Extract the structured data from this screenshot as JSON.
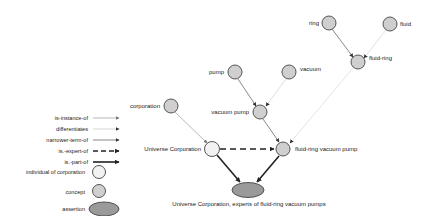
{
  "colors": {
    "concept_fill": "#cfcfcf",
    "individual_fill": "#f2f2f2",
    "assertion_fill": "#9a9a9a",
    "stroke": "#444444",
    "instance_line": "#888888",
    "differentiates_line": "#bbbbbb",
    "narrower_line": "#555555",
    "expert_line": "#222222",
    "part_line": "#222222"
  },
  "legend": {
    "edges": [
      {
        "label": "is-instance-of",
        "style": "instance"
      },
      {
        "label": "differentiates",
        "style": "differentiates"
      },
      {
        "label": "narrower-term-of",
        "style": "narrower"
      },
      {
        "label": "is.-expert-of",
        "style": "expert"
      },
      {
        "label": "is.-part-of",
        "style": "part"
      }
    ],
    "nodes": [
      {
        "label": "individual of corporation",
        "shape": "individual"
      },
      {
        "label": "concept",
        "shape": "concept"
      },
      {
        "label": "assertion",
        "shape": "assertion"
      }
    ]
  },
  "nodes": {
    "ring": {
      "label": "ring",
      "type": "concept"
    },
    "fluid": {
      "label": "fluid",
      "type": "concept"
    },
    "fluid_ring": {
      "label": "fluid-ring",
      "type": "concept"
    },
    "pump": {
      "label": "pump",
      "type": "concept"
    },
    "vacuum": {
      "label": "vacuum",
      "type": "concept"
    },
    "vacuum_pump": {
      "label": "vacuum pump",
      "type": "concept"
    },
    "corporation": {
      "label": "corporation",
      "type": "concept"
    },
    "universe_corporation": {
      "label": "Universe Corporation",
      "type": "individual"
    },
    "fluid_ring_vacuum_pump": {
      "label": "fluid-ring vacuum pump",
      "type": "concept"
    },
    "assertion": {
      "label": "Universe Corporation, experts of fluid-ring vacuum pumps",
      "type": "assertion"
    }
  },
  "edges": [
    {
      "from": "ring",
      "to": "fluid_ring",
      "relation": "narrower-term-of"
    },
    {
      "from": "fluid",
      "to": "fluid_ring",
      "relation": "differentiates"
    },
    {
      "from": "pump",
      "to": "vacuum_pump",
      "relation": "narrower-term-of"
    },
    {
      "from": "vacuum",
      "to": "vacuum_pump",
      "relation": "differentiates"
    },
    {
      "from": "vacuum_pump",
      "to": "fluid_ring_vacuum_pump",
      "relation": "narrower-term-of"
    },
    {
      "from": "fluid_ring",
      "to": "fluid_ring_vacuum_pump",
      "relation": "differentiates"
    },
    {
      "from": "corporation",
      "to": "universe_corporation",
      "relation": "is-instance-of"
    },
    {
      "from": "universe_corporation",
      "to": "fluid_ring_vacuum_pump",
      "relation": "is.-expert-of"
    },
    {
      "from": "universe_corporation",
      "to": "assertion",
      "relation": "is.-part-of"
    },
    {
      "from": "fluid_ring_vacuum_pump",
      "to": "assertion",
      "relation": "is.-part-of"
    }
  ]
}
